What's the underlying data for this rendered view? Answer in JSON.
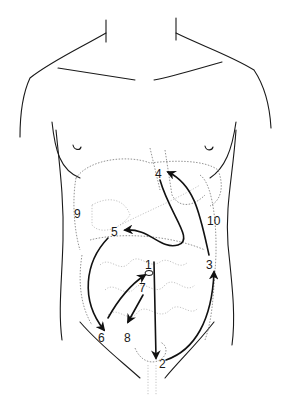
{
  "diagram": {
    "type": "anatomical-torso",
    "labels": [
      {
        "id": "1",
        "text": "1",
        "x": 145,
        "y": 259
      },
      {
        "id": "2",
        "text": "2",
        "x": 159,
        "y": 362
      },
      {
        "id": "3",
        "text": "3",
        "x": 208,
        "y": 261
      },
      {
        "id": "4",
        "text": "4",
        "x": 157,
        "y": 168
      },
      {
        "id": "5",
        "text": "5",
        "x": 113,
        "y": 226
      },
      {
        "id": "6",
        "text": "6",
        "x": 98,
        "y": 333
      },
      {
        "id": "7",
        "text": "7",
        "x": 140,
        "y": 284
      },
      {
        "id": "8",
        "text": "8",
        "x": 124,
        "y": 333
      },
      {
        "id": "9",
        "text": "9",
        "x": 74,
        "y": 208
      },
      {
        "id": "10",
        "text": "10",
        "x": 208,
        "y": 215
      }
    ],
    "colors": {
      "outline": "#1a1a1a",
      "organs": "#777777",
      "arrows": "#111111",
      "background": "#ffffff"
    }
  }
}
